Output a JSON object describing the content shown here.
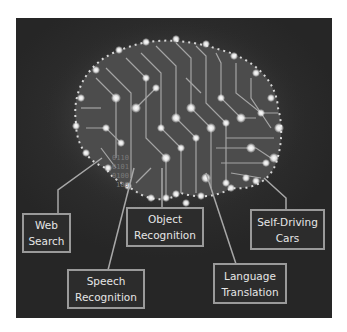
{
  "diagram": {
    "binary_text": [
      "0110",
      "0101",
      "0100",
      "100"
    ],
    "applications": [
      {
        "id": "web-search",
        "lines": [
          "Web",
          "Search"
        ]
      },
      {
        "id": "speech-recognition",
        "lines": [
          "Speech",
          "Recognition"
        ]
      },
      {
        "id": "object-recognition",
        "lines": [
          "Object",
          "Recognition"
        ]
      },
      {
        "id": "language-translation",
        "lines": [
          "Language",
          "Translation"
        ]
      },
      {
        "id": "self-driving-cars",
        "lines": [
          "Self-Driving",
          "Cars"
        ]
      }
    ],
    "colors": {
      "background": "#2a2a2a",
      "box_border": "#9a9a9a",
      "box_text": "#e6e6e6",
      "connector": "#a8a8a8",
      "glow": "#ffffff"
    }
  }
}
